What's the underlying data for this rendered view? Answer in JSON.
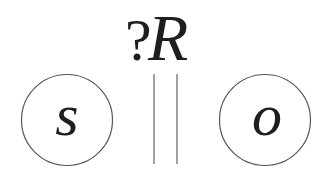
{
  "diagram": {
    "relation": {
      "prefix": "?",
      "symbol": "R"
    },
    "nodes": [
      {
        "id": "subject",
        "label": "s"
      },
      {
        "id": "object",
        "label": "o"
      }
    ],
    "separator": "parallel-lines",
    "colors": {
      "text": "#1e1e1e",
      "circle_stroke": "#555555",
      "separator_stroke": "#8a8a8a",
      "background": "#ffffff"
    }
  }
}
